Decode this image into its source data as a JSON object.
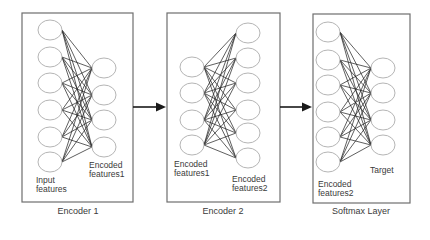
{
  "panels": [
    {
      "id": "encoder1",
      "caption": "Encoder 1",
      "box": {
        "x": 22,
        "y": 13,
        "w": 111,
        "h": 189
      },
      "captionPos": {
        "x": 18,
        "y": 206
      },
      "layers": [
        {
          "cx": 50,
          "ys": [
            30,
            57,
            83,
            110,
            137,
            162
          ],
          "label": "Input\nfeatures",
          "labelPos": {
            "x": 36,
            "y": 176
          }
        },
        {
          "cx": 104,
          "ys": [
            68,
            95,
            120,
            147
          ],
          "label": "Encoded\nfeatures1",
          "labelPos": {
            "x": 89,
            "y": 161
          }
        }
      ]
    },
    {
      "id": "encoder2",
      "caption": "Encoder 2",
      "box": {
        "x": 167,
        "y": 13,
        "w": 113,
        "h": 189
      },
      "captionPos": {
        "x": 163,
        "y": 206
      },
      "layers": [
        {
          "cx": 192,
          "ys": [
            67,
            93,
            120,
            145
          ],
          "label": "Encoded\nfeatures1",
          "labelPos": {
            "x": 174,
            "y": 160
          }
        },
        {
          "cx": 248,
          "ys": [
            33,
            58,
            83,
            110,
            133,
            158
          ],
          "label": "Encoded\nfeatures2",
          "labelPos": {
            "x": 232,
            "y": 175
          }
        }
      ]
    },
    {
      "id": "softmax",
      "caption": "Softmax Layer",
      "box": {
        "x": 313,
        "y": 14,
        "w": 97,
        "h": 189
      },
      "captionPos": {
        "x": 301,
        "y": 206
      },
      "layers": [
        {
          "cx": 328,
          "ys": [
            32,
            60,
            85,
            112,
            137,
            162
          ],
          "label": "Encoded\nfeatures2",
          "labelPos": {
            "x": 318,
            "y": 180
          }
        },
        {
          "cx": 383,
          "ys": [
            68,
            93,
            120,
            145
          ],
          "label": "Target",
          "labelPos": {
            "x": 370,
            "y": 166
          }
        }
      ]
    }
  ],
  "arrows": [
    {
      "from": "encoder1",
      "to": "encoder2",
      "x1": 133,
      "x2": 166,
      "y": 107
    },
    {
      "from": "encoder2",
      "to": "softmax",
      "x1": 280,
      "x2": 312,
      "y": 107
    }
  ],
  "node_radius": {
    "rx": 12,
    "ry": 10
  },
  "colors": {
    "box": "#6e6e6e",
    "node": "#b5b5b5",
    "edge": "#222222",
    "arrow": "#1a1a1a",
    "text": "#3a3a3a"
  }
}
